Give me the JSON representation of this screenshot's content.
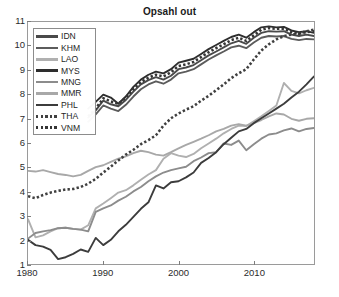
{
  "figure": {
    "title": "Opsahl out",
    "background": "#ffffff",
    "axis_color": "#9a9a9a"
  },
  "legend": {
    "position": "top-left-inside",
    "entries": [
      {
        "label": "IDN",
        "color": "#4a4a4a",
        "style": "solid"
      },
      {
        "label": "KHM",
        "color": "#5c5c5c",
        "style": "solid"
      },
      {
        "label": "LAO",
        "color": "#b0b0b0",
        "style": "solid"
      },
      {
        "label": "MYS",
        "color": "#2e2e2e",
        "style": "solid"
      },
      {
        "label": "MNG",
        "color": "#8c8c8c",
        "style": "solid"
      },
      {
        "label": "MMR",
        "color": "#a8a8a8",
        "style": "solid"
      },
      {
        "label": "PHL",
        "color": "#3c3c3c",
        "style": "solid"
      },
      {
        "label": "THA",
        "color": "#404040",
        "style": "dotted"
      },
      {
        "label": "VNM",
        "color": "#353535",
        "style": "dotted"
      }
    ]
  },
  "axes": {
    "y_ticks": [
      "11",
      "10",
      "9",
      "8",
      "7",
      "6",
      "5",
      "4",
      "3",
      "2",
      "1"
    ],
    "x_ticks": [
      "1980",
      "1990",
      "2000",
      "2010"
    ]
  },
  "chart_data": {
    "type": "line",
    "title": "Opsahl out",
    "xlabel": "",
    "ylabel": "",
    "xlim": [
      1980,
      2018
    ],
    "ylim": [
      1,
      11
    ],
    "grid": false,
    "legend_position": "upper left (inside axes)",
    "x": [
      1980,
      1981,
      1982,
      1983,
      1984,
      1985,
      1986,
      1987,
      1988,
      1989,
      1990,
      1991,
      1992,
      1993,
      1994,
      1995,
      1996,
      1997,
      1998,
      1999,
      2000,
      2001,
      2002,
      2003,
      2004,
      2005,
      2006,
      2007,
      2008,
      2009,
      2010,
      2011,
      2012,
      2013,
      2014,
      2015,
      2016,
      2017,
      2018
    ],
    "series": [
      {
        "name": "IDN",
        "color": "#4a4a4a",
        "style": "solid",
        "values": [
          null,
          null,
          null,
          null,
          null,
          null,
          null,
          null,
          7.05,
          7.35,
          7.75,
          7.6,
          7.52,
          7.78,
          8.12,
          8.42,
          8.6,
          8.72,
          8.62,
          8.78,
          9.05,
          9.12,
          9.22,
          9.42,
          9.62,
          9.78,
          9.95,
          10.12,
          10.22,
          10.1,
          10.35,
          10.55,
          10.62,
          10.6,
          10.62,
          10.48,
          10.42,
          10.48,
          10.42
        ]
      },
      {
        "name": "KHM",
        "color": "#5c5c5c",
        "style": "solid",
        "values": [
          null,
          null,
          null,
          null,
          null,
          null,
          null,
          null,
          6.88,
          7.18,
          7.55,
          7.42,
          7.32,
          7.58,
          7.92,
          8.22,
          8.42,
          8.55,
          8.45,
          8.62,
          8.88,
          8.95,
          9.05,
          9.25,
          9.45,
          9.62,
          9.78,
          9.95,
          10.02,
          9.92,
          10.15,
          10.35,
          10.42,
          10.4,
          10.42,
          10.3,
          10.25,
          10.3,
          10.28
        ]
      },
      {
        "name": "LAO",
        "color": "#b0b0b0",
        "style": "solid",
        "values": [
          2.85,
          2.1,
          2.18,
          2.35,
          2.48,
          2.5,
          2.45,
          2.42,
          2.6,
          3.3,
          3.5,
          3.72,
          3.95,
          4.05,
          4.25,
          4.48,
          4.7,
          4.88,
          5.35,
          5.58,
          5.48,
          5.42,
          5.55,
          5.78,
          5.98,
          6.18,
          6.4,
          6.58,
          6.72,
          6.7,
          6.9,
          7.1,
          7.32,
          7.55,
          8.48,
          8.15,
          8.05,
          8.18,
          8.28
        ]
      },
      {
        "name": "MYS",
        "color": "#2e2e2e",
        "style": "solid",
        "values": [
          null,
          null,
          null,
          null,
          null,
          null,
          null,
          null,
          7.42,
          7.7,
          8.0,
          7.88,
          7.62,
          7.92,
          8.32,
          8.62,
          8.82,
          8.95,
          8.88,
          9.05,
          9.32,
          9.4,
          9.48,
          9.68,
          9.88,
          10.05,
          10.22,
          10.38,
          10.48,
          10.35,
          10.58,
          10.78,
          10.82,
          10.78,
          10.8,
          10.65,
          10.58,
          10.62,
          10.55
        ]
      },
      {
        "name": "MNG",
        "color": "#8c8c8c",
        "style": "solid",
        "values": [
          2.05,
          2.28,
          2.35,
          2.4,
          2.48,
          2.5,
          2.45,
          2.42,
          2.35,
          3.15,
          3.3,
          3.42,
          3.62,
          3.78,
          4.0,
          4.18,
          4.42,
          4.62,
          4.78,
          4.88,
          4.95,
          5.02,
          5.25,
          5.4,
          5.58,
          5.62,
          5.98,
          5.92,
          6.1,
          5.7,
          5.95,
          6.18,
          6.35,
          6.4,
          6.52,
          6.6,
          6.48,
          6.58,
          6.62
        ]
      },
      {
        "name": "MMR",
        "color": "#a8a8a8",
        "style": "solid",
        "values": [
          4.85,
          4.82,
          4.88,
          4.8,
          4.72,
          4.68,
          4.62,
          4.68,
          4.85,
          5.0,
          5.08,
          5.22,
          5.35,
          5.45,
          5.58,
          5.68,
          5.62,
          5.52,
          5.48,
          5.62,
          5.78,
          5.92,
          6.05,
          6.18,
          6.32,
          6.48,
          6.58,
          6.72,
          6.78,
          6.72,
          6.82,
          6.95,
          7.1,
          7.22,
          7.18,
          7.0,
          6.92,
          7.0,
          7.02
        ]
      },
      {
        "name": "PHL",
        "color": "#3c3c3c",
        "style": "solid",
        "values": [
          2.0,
          1.78,
          1.72,
          1.58,
          1.2,
          1.28,
          1.42,
          1.6,
          1.5,
          2.08,
          1.78,
          2.0,
          2.35,
          2.62,
          2.95,
          3.28,
          3.55,
          4.25,
          4.12,
          4.38,
          4.42,
          4.58,
          4.78,
          5.18,
          5.38,
          5.62,
          5.95,
          6.22,
          6.48,
          6.58,
          6.82,
          7.02,
          7.22,
          7.42,
          7.62,
          7.88,
          8.12,
          8.42,
          8.75
        ]
      },
      {
        "name": "THA",
        "color": "#404040",
        "style": "dotted",
        "values": [
          3.8,
          3.72,
          3.85,
          3.95,
          4.02,
          4.08,
          4.1,
          4.18,
          4.32,
          4.52,
          4.78,
          5.02,
          5.28,
          5.52,
          5.72,
          5.95,
          6.12,
          6.32,
          6.72,
          7.02,
          7.22,
          7.38,
          7.52,
          7.75,
          7.95,
          8.18,
          8.42,
          8.68,
          8.88,
          9.05,
          9.45,
          9.82,
          10.08,
          10.28,
          10.42,
          10.48,
          10.52,
          10.62,
          10.68
        ]
      },
      {
        "name": "VNM",
        "color": "#353535",
        "style": "dotted",
        "values": [
          null,
          null,
          null,
          null,
          null,
          null,
          null,
          null,
          7.1,
          7.42,
          7.85,
          7.72,
          7.62,
          7.88,
          8.22,
          8.52,
          8.7,
          8.82,
          8.75,
          8.92,
          9.18,
          9.25,
          9.35,
          9.55,
          9.75,
          9.92,
          10.08,
          10.25,
          10.35,
          10.22,
          10.45,
          10.68,
          10.75,
          10.72,
          10.72,
          10.58,
          10.52,
          10.58,
          10.62
        ]
      }
    ]
  }
}
